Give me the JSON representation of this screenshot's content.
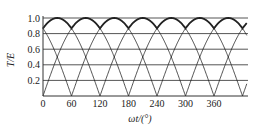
{
  "chart_data": {
    "type": "line",
    "title": "",
    "xlabel": "ωt/(°)",
    "ylabel": "T/E",
    "xlim": [
      0,
      460
    ],
    "ylim": [
      0,
      1.0
    ],
    "x_ticks": [
      0,
      60,
      120,
      180,
      240,
      300,
      360
    ],
    "x_tick_labels": [
      "0",
      "60",
      "120",
      "180",
      "240",
      "300",
      "360"
    ],
    "y_ticks": [
      0.2,
      0.4,
      0.6,
      0.8,
      1.0
    ],
    "y_tick_labels": [
      "0.2",
      "0.4",
      "0.6",
      "0.8",
      "1.0"
    ],
    "grid": {
      "horizontal": true,
      "vertical": false
    },
    "legend": null,
    "series": [
      {
        "name": "phase-1 |sin(ωt)|",
        "style": "thin",
        "zeros_at_deg": [
          0,
          180,
          360
        ],
        "peak": 1.0
      },
      {
        "name": "phase-2 |sin(ωt-60°)|",
        "style": "thin",
        "zeros_at_deg": [
          60,
          240,
          420
        ],
        "peak": 1.0
      },
      {
        "name": "phase-3 |sin(ωt-120°)|",
        "style": "thin",
        "zeros_at_deg": [
          120,
          300
        ],
        "peak": 1.0
      },
      {
        "name": "envelope (max)",
        "style": "bold",
        "min": 0.866,
        "max": 1.0,
        "peaks_at_deg": [
          30,
          90,
          150,
          210,
          270,
          330,
          390,
          450
        ]
      }
    ],
    "crossing_value": 0.5,
    "colors": {
      "line": "#222222",
      "grid": "#555555",
      "axis": "#333333"
    }
  },
  "labels": {
    "ylabel": "T/E",
    "xlabel": "ωt/(°)"
  }
}
